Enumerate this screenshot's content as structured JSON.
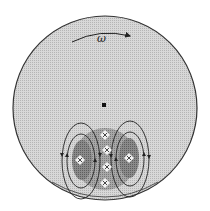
{
  "diagram": {
    "rotation_label": "ω",
    "colors": {
      "disk_fill": "#cfcfcf",
      "disk_stroke": "#333333",
      "blob_fill": "#9a9a9a",
      "lobe_fill": "#7e7e7e",
      "line": "#222222",
      "marker_fill": "#f2f2f2"
    },
    "markers": [
      {
        "x": 105,
        "y": 135
      },
      {
        "x": 107,
        "y": 150
      },
      {
        "x": 107,
        "y": 167
      },
      {
        "x": 105,
        "y": 183
      },
      {
        "x": 80,
        "y": 160
      },
      {
        "x": 129,
        "y": 158
      }
    ]
  }
}
